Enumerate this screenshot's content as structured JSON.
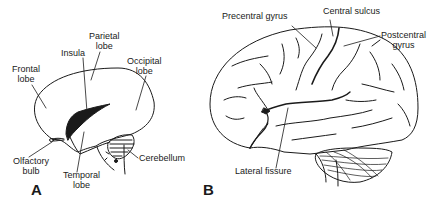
{
  "figure": {
    "panel_a": {
      "letter": "A",
      "labels": {
        "frontal_lobe_1": "Frontal",
        "frontal_lobe_2": "lobe",
        "parietal_lobe_1": "Parietal",
        "parietal_lobe_2": "lobe",
        "insula": "Insula",
        "occipital_lobe_1": "Occipital",
        "occipital_lobe_2": "lobe",
        "olfactory_bulb_1": "Olfactory",
        "olfactory_bulb_2": "bulb",
        "temporal_lobe_1": "Temporal",
        "temporal_lobe_2": "lobe",
        "cerebellum": "Cerebellum"
      }
    },
    "panel_b": {
      "letter": "B",
      "labels": {
        "precentral_gyrus": "Precentral gyrus",
        "central_sulcus": "Central sulcus",
        "postcentral_gyrus_1": "Postcentral",
        "postcentral_gyrus_2": "gyrus",
        "lateral_fissure": "Lateral fissure"
      }
    },
    "colors": {
      "ink": "#1a1a1a",
      "background": "#ffffff"
    }
  }
}
